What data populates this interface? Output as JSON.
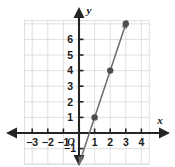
{
  "figure": {
    "background_color": "#ffffff",
    "grid_color": "#d8d8d8",
    "axis_color": "#242424",
    "plot_color": "#6b6b6b",
    "point_color": "#4d4d4d",
    "text_color": "#1a1a1a"
  },
  "chart_data": {
    "type": "line",
    "title": "",
    "xlabel": "x",
    "ylabel": "y",
    "xlim": [
      -3.5,
      4.5
    ],
    "ylim": [
      -2,
      7.2
    ],
    "grid": true,
    "legend": null,
    "x_ticks": [
      -3,
      -2,
      -1,
      1,
      2,
      3,
      4
    ],
    "x_tick_labels": [
      "−3",
      "−2",
      "−1",
      "1",
      "2",
      "3",
      "4"
    ],
    "y_ticks": [
      -1,
      1,
      2,
      3,
      4,
      5,
      6
    ],
    "y_tick_labels": [
      "−1",
      "1",
      "2",
      "3",
      "4",
      "5",
      "6"
    ],
    "origin_label": "O",
    "series": [
      {
        "name": "line",
        "slope": 3,
        "intercept": -2,
        "arrow_start": true,
        "arrow_end": true,
        "x": [
          1,
          2,
          3
        ],
        "y": [
          1,
          4,
          7
        ],
        "points": [
          {
            "x": 1,
            "y": 1
          },
          {
            "x": 2,
            "y": 4
          },
          {
            "x": 3,
            "y": 7
          }
        ]
      }
    ]
  }
}
